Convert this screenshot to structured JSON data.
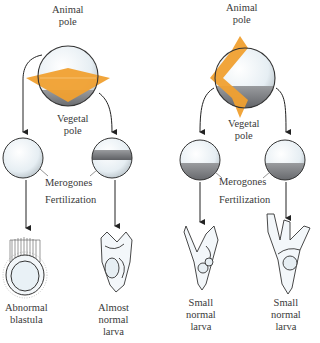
{
  "experiment_left": {
    "name": "equatorial-cut",
    "top_label": [
      "Animal",
      "pole"
    ],
    "bottom_label": [
      "Vegetal",
      "pole"
    ],
    "merogone_label": "Merogones",
    "process_label": "Fertilization",
    "outcomes": [
      {
        "label": [
          "Abnormal",
          "blastula"
        ]
      },
      {
        "label": [
          "Almost",
          "normal",
          "larva"
        ]
      }
    ]
  },
  "experiment_right": {
    "name": "meridional-cut",
    "top_label": [
      "Animal",
      "pole"
    ],
    "bottom_label": [
      "Vegetal",
      "pole"
    ],
    "merogone_label": "Merogones",
    "process_label": "Fertilization",
    "outcomes": [
      {
        "label": [
          "Small",
          "normal",
          "larva"
        ]
      },
      {
        "label": [
          "Small",
          "normal",
          "larva"
        ]
      }
    ]
  },
  "colors": {
    "cut_plane": "#f0a030",
    "sphere_fill": "#eef4f8",
    "vegetal_band": "#8a8c90",
    "outline": "#333333"
  }
}
